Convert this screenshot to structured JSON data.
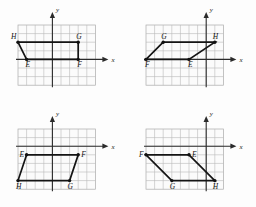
{
  "figure": {
    "panel_count": 4,
    "grid": {
      "columns": 9,
      "rows": 7,
      "cell_px": 8.6,
      "grid_color": "#b9b9b9",
      "axis_color": "#2b2b2b",
      "shape_color": "#141414"
    },
    "axis_labels": {
      "x": "x",
      "y": "y"
    },
    "panels": [
      {
        "id": "panel-top-left",
        "position": "top-left",
        "origin_cell": [
          4,
          4
        ],
        "vertices": [
          {
            "name": "E",
            "cell": [
              1,
              4
            ],
            "label_dx": -1,
            "label_dy": 8
          },
          {
            "name": "F",
            "cell": [
              7,
              4
            ],
            "label_dx": -1,
            "label_dy": 8
          },
          {
            "name": "G",
            "cell": [
              7,
              2
            ],
            "label_dx": -2,
            "label_dy": -3
          },
          {
            "name": "H",
            "cell": [
              0,
              2
            ],
            "label_dx": -7,
            "label_dy": -3
          }
        ],
        "order": [
          "E",
          "F",
          "G",
          "H"
        ]
      },
      {
        "id": "panel-top-right",
        "position": "top-right",
        "origin_cell": [
          7,
          4
        ],
        "vertices": [
          {
            "name": "E",
            "cell": [
              5,
              4
            ],
            "label_dx": -1,
            "label_dy": 8
          },
          {
            "name": "F",
            "cell": [
              0,
              4
            ],
            "label_dx": -1,
            "label_dy": 8
          },
          {
            "name": "G",
            "cell": [
              2,
              2
            ],
            "label_dx": -2,
            "label_dy": -3
          },
          {
            "name": "H",
            "cell": [
              8,
              2
            ],
            "label_dx": -2,
            "label_dy": -3
          }
        ],
        "order": [
          "E",
          "F",
          "G",
          "H"
        ]
      },
      {
        "id": "panel-bottom-left",
        "position": "bottom-left",
        "origin_cell": [
          4,
          2
        ],
        "vertices": [
          {
            "name": "E",
            "cell": [
              1,
              3
            ],
            "label_dx": -7,
            "label_dy": 2
          },
          {
            "name": "F",
            "cell": [
              7,
              3
            ],
            "label_dx": 3,
            "label_dy": 2
          },
          {
            "name": "G",
            "cell": [
              6,
              6
            ],
            "label_dx": -2,
            "label_dy": 8
          },
          {
            "name": "H",
            "cell": [
              0,
              6
            ],
            "label_dx": -2,
            "label_dy": 8
          }
        ],
        "order": [
          "E",
          "F",
          "G",
          "H"
        ]
      },
      {
        "id": "panel-bottom-right",
        "position": "bottom-right",
        "origin_cell": [
          7,
          2
        ],
        "vertices": [
          {
            "name": "E",
            "cell": [
              5,
              3
            ],
            "label_dx": 3,
            "label_dy": 2
          },
          {
            "name": "F",
            "cell": [
              0,
              3
            ],
            "label_dx": -7,
            "label_dy": 2
          },
          {
            "name": "G",
            "cell": [
              3,
              6
            ],
            "label_dx": -2,
            "label_dy": 8
          },
          {
            "name": "H",
            "cell": [
              8,
              6
            ],
            "label_dx": -2,
            "label_dy": 8
          }
        ],
        "order": [
          "E",
          "F",
          "G",
          "H"
        ]
      }
    ]
  }
}
